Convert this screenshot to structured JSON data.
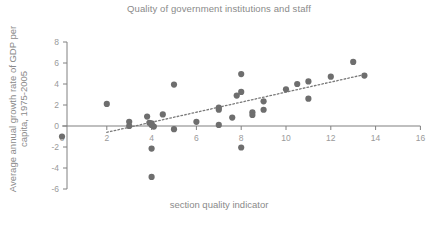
{
  "chart_data": {
    "type": "scatter",
    "title": "Quality of government institutions and staff",
    "xlabel": "section quality indicator",
    "ylabel": "Average annual growth rate of GDP per capita, 1975-2005",
    "xlim": [
      0,
      16
    ],
    "ylim": [
      -6,
      8
    ],
    "xticks": [
      0,
      2,
      4,
      6,
      8,
      10,
      12,
      14,
      16
    ],
    "yticks": [
      -6,
      -4,
      -2,
      0,
      2,
      4,
      6,
      8
    ],
    "xtick_labels": [
      "0",
      "2",
      "4",
      "6",
      "8",
      "10",
      "12",
      "14",
      "16"
    ],
    "ytick_labels": [
      "-6",
      "-4",
      "-2",
      "0",
      "2",
      "4",
      "6",
      "8"
    ],
    "grid": false,
    "legend": false,
    "marker_color": "#6e6e6e",
    "marker_size": 5,
    "axis_color": "#808080",
    "text_color": "#8a8a8a",
    "points": [
      {
        "x": 2.0,
        "y": 2.1
      },
      {
        "x": 3.0,
        "y": 0.4
      },
      {
        "x": 3.0,
        "y": 0.0
      },
      {
        "x": 3.8,
        "y": 0.9
      },
      {
        "x": 3.9,
        "y": 0.3
      },
      {
        "x": 4.0,
        "y": 0.25
      },
      {
        "x": 4.0,
        "y": 0.1
      },
      {
        "x": 4.1,
        "y": -0.05
      },
      {
        "x": 4.0,
        "y": -2.15
      },
      {
        "x": 4.0,
        "y": -4.85
      },
      {
        "x": 4.5,
        "y": 1.1
      },
      {
        "x": 5.0,
        "y": 3.95
      },
      {
        "x": 5.0,
        "y": -0.3
      },
      {
        "x": 6.0,
        "y": 0.4
      },
      {
        "x": 7.0,
        "y": 1.75
      },
      {
        "x": 7.0,
        "y": 1.55
      },
      {
        "x": 7.0,
        "y": 0.1
      },
      {
        "x": 7.6,
        "y": 0.8
      },
      {
        "x": 7.8,
        "y": 2.9
      },
      {
        "x": 8.0,
        "y": 4.95
      },
      {
        "x": 8.0,
        "y": 3.25
      },
      {
        "x": 8.0,
        "y": -2.05
      },
      {
        "x": 8.5,
        "y": 1.3
      },
      {
        "x": 8.5,
        "y": 1.05
      },
      {
        "x": 9.0,
        "y": 2.35
      },
      {
        "x": 9.0,
        "y": 1.55
      },
      {
        "x": 10.0,
        "y": 3.5
      },
      {
        "x": 10.5,
        "y": 4.0
      },
      {
        "x": 11.0,
        "y": 4.25
      },
      {
        "x": 11.0,
        "y": 2.6
      },
      {
        "x": 12.0,
        "y": 4.7
      },
      {
        "x": 13.0,
        "y": 6.1
      },
      {
        "x": 13.5,
        "y": 4.8
      },
      {
        "x": 0.0,
        "y": -1.0
      }
    ],
    "trendline": {
      "style": "dotted",
      "color": "#7a7a7a",
      "x_start": 2.0,
      "y_start": -0.6,
      "x_end": 13.5,
      "y_end": 4.9
    }
  }
}
